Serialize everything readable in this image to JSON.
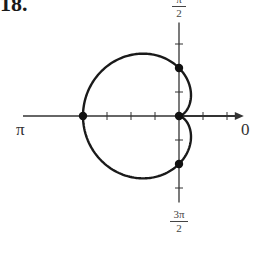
{
  "problem_number": "18.",
  "chart_data": {
    "type": "line",
    "coordinate_system": "polar",
    "title": "",
    "equation": "r = 2 - 2cos(theta)",
    "curve_name": "cardioid",
    "axis_labels": {
      "theta_0": "0",
      "theta_pi_over_2": {
        "numerator": "π",
        "denominator": "2"
      },
      "theta_pi": "π",
      "theta_3pi_over_2": {
        "numerator": "3π",
        "denominator": "2"
      }
    },
    "tick_spacing": 1,
    "ticks_visible": {
      "positive_x": [
        1,
        2
      ],
      "negative_x": [
        1,
        2,
        3
      ],
      "positive_y": [
        1,
        3
      ],
      "negative_y": [
        1,
        3
      ]
    },
    "axis_ranges": {
      "x": [
        -6.5,
        2.7
      ],
      "y": [
        -3.6,
        3.9
      ]
    },
    "grid": false,
    "legend": null,
    "marked_points": [
      {
        "theta": "0",
        "r": 0,
        "x": 0,
        "y": 0
      },
      {
        "theta": "π/2",
        "r": 2,
        "x": 0,
        "y": 2
      },
      {
        "theta": "π",
        "r": 4,
        "x": -4,
        "y": 0
      },
      {
        "theta": "3π/2",
        "r": 2,
        "x": 0,
        "y": -2
      }
    ],
    "series": [
      {
        "name": "r = 2 - 2cosθ",
        "color": "#1a1a1a",
        "theta_range": [
          0,
          6.2832
        ]
      }
    ]
  },
  "style": {
    "curve_color": "#1a1a1a",
    "axis_color": "#333333",
    "point_color": "#111111",
    "origin_px": [
      179,
      116
    ],
    "unit_px": 24
  }
}
